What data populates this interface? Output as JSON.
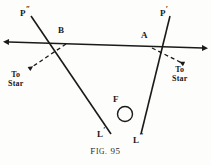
{
  "figure": {
    "caption_prefix": "F",
    "caption_small": "IG.",
    "caption_number": "95",
    "caption_full": "FIG. 95",
    "background_color": "#fdfdfb",
    "ink_color": "#1a1a18"
  },
  "labels": {
    "p_left": {
      "base": "P",
      "prime": "″",
      "name": "point-p-double-prime"
    },
    "p_right": {
      "base": "P",
      "prime": "′",
      "name": "point-p-prime"
    },
    "b": {
      "base": "B",
      "name": "point-b"
    },
    "a": {
      "base": "A",
      "name": "point-a"
    },
    "f": {
      "base": "F",
      "name": "point-f"
    },
    "l_left": {
      "base": "L",
      "prime": "′",
      "name": "point-l-prime"
    },
    "l_right": {
      "base": "L",
      "prime": "″",
      "name": "point-l-double-prime"
    },
    "star_left": {
      "line1": "To",
      "line2": "Star"
    },
    "star_right": {
      "line1": "To",
      "line2": "Star"
    }
  },
  "geometry": {
    "baseline": {
      "x1": 9,
      "y1": 42,
      "x2": 203,
      "y2": 48,
      "style": "solid-double-arrow"
    },
    "line_p_left_to_l_left": {
      "x1": 31,
      "y1": 16,
      "x2": 110,
      "y2": 133,
      "style": "solid"
    },
    "line_p_right_to_l_right": {
      "x1": 170,
      "y1": 16,
      "x2": 140,
      "y2": 133,
      "style": "solid"
    },
    "dashed_b_to_star": {
      "x1": 68,
      "y1": 44,
      "x2": 27,
      "y2": 70,
      "style": "dashed-arrow"
    },
    "dashed_a_to_star": {
      "x1": 150,
      "y1": 48,
      "x2": 185,
      "y2": 64,
      "style": "dashed-arrow"
    },
    "focus_circle": {
      "cx": 125,
      "cy": 114,
      "r": 7.5
    }
  }
}
